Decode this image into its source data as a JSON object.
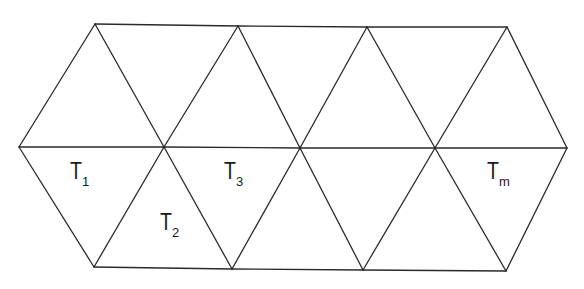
{
  "diagram": {
    "title": "",
    "type": "triangulated strip of equilateral triangles",
    "colors": {
      "stroke": "#2a2a2a",
      "background": "#ffffff",
      "text": "#1a1a1a"
    },
    "vertices": {
      "top": [
        [
          95,
          24
        ],
        [
          238,
          26
        ],
        [
          367,
          27
        ],
        [
          507,
          27
        ]
      ],
      "middle": [
        [
          19,
          147
        ],
        [
          164,
          147
        ],
        [
          300,
          148
        ],
        [
          435,
          148
        ],
        [
          567,
          148
        ]
      ],
      "bottom": [
        [
          94,
          267
        ],
        [
          232,
          269
        ],
        [
          363,
          270
        ],
        [
          506,
          271
        ]
      ]
    },
    "labels": [
      {
        "id": "T1",
        "main": "T",
        "sub": "1",
        "x": 70,
        "y": 160
      },
      {
        "id": "T2",
        "main": "T",
        "sub": "2",
        "x": 160,
        "y": 211
      },
      {
        "id": "T3",
        "main": "T",
        "sub": "3",
        "x": 224,
        "y": 160
      },
      {
        "id": "Tm",
        "main": "T",
        "sub": "m",
        "x": 487,
        "y": 160
      }
    ]
  }
}
